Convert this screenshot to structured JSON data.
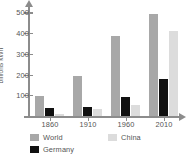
{
  "chart_data": {
    "type": "bar",
    "title": "",
    "xlabel": "",
    "ylabel": "billions kWh",
    "categories": [
      "1860",
      "1910",
      "1960",
      "2010"
    ],
    "series": [
      {
        "name": "World",
        "color": "#a8a8a8",
        "values": [
          100,
          200,
          400,
          510
        ]
      },
      {
        "name": "Germany",
        "color": "#111111",
        "values": [
          40,
          47,
          97,
          185
        ]
      },
      {
        "name": "China",
        "color": "#dcdcdc",
        "values": [
          8,
          35,
          53,
          425
        ]
      }
    ],
    "ylim": [
      0,
      550
    ],
    "yticks": [
      100,
      200,
      300,
      400,
      500
    ],
    "ytick_labels": [
      "100",
      "200",
      "300",
      "400",
      "500"
    ],
    "grid": false,
    "legend_position": "bottom"
  },
  "axis": {
    "y_title": "billions kWh",
    "ytick_labels": [
      "500",
      "400",
      "300",
      "200",
      "100"
    ],
    "xtick_labels": [
      "1860",
      "1910",
      "1960",
      "2010"
    ]
  },
  "legend": {
    "items": [
      {
        "label": "World",
        "color": "#a8a8a8"
      },
      {
        "label": "China",
        "color": "#dcdcdc"
      },
      {
        "label": "Germany",
        "color": "#111111"
      }
    ]
  }
}
